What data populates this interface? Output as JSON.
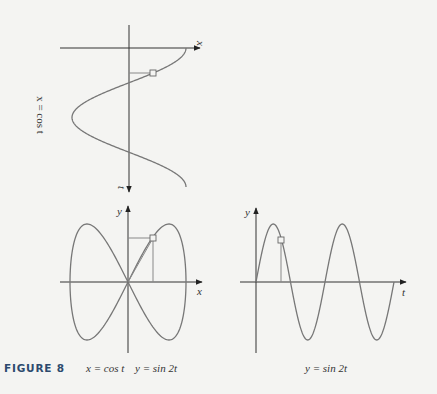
{
  "figure_label": "FIGURE 8",
  "chart_data": [
    {
      "type": "line",
      "name": "top-plot",
      "title": "x = cos t",
      "orientation": "rotated: x-axis horizontal pointing right, t-axis vertical pointing down",
      "xlabel": "x",
      "ylabel": "t",
      "function": "x = cos t",
      "t_range": [
        0,
        6.2832
      ],
      "x_range": [
        -1,
        1
      ],
      "marked_point": {
        "t": 1.13,
        "x": 0.43
      },
      "grid": false
    },
    {
      "type": "line",
      "name": "bottom-left-plot",
      "title": "x = cos t   y = sin 2t",
      "xlabel": "x",
      "ylabel": "y",
      "parametric": {
        "x": "cos t",
        "y": "sin 2t"
      },
      "t_range": [
        0,
        6.2832
      ],
      "x_range": [
        -1,
        1
      ],
      "y_range": [
        -1,
        1
      ],
      "marked_point": {
        "t": 1.13,
        "x": 0.43,
        "y": 0.77
      },
      "grid": false
    },
    {
      "type": "line",
      "name": "bottom-right-plot",
      "title": "y = sin 2t",
      "xlabel": "t",
      "ylabel": "y",
      "function": "y = sin 2t",
      "t_range": [
        0,
        6.2832
      ],
      "y_range": [
        -1,
        1
      ],
      "marked_point": {
        "t": 1.13,
        "y": 0.77
      },
      "grid": false
    }
  ],
  "labels": {
    "top_x": "x",
    "top_t": "t",
    "top_side": "x = cos t",
    "left_y": "y",
    "left_x": "x",
    "right_y": "y",
    "right_t": "t",
    "caption_left_x": "x = cos t",
    "caption_left_y": "y = sin 2t",
    "caption_right": "y = sin 2t"
  },
  "colors": {
    "axis": "#333333",
    "curve": "#777777",
    "figure_label": "#2c4a6e",
    "background": "#f4f4f2"
  }
}
